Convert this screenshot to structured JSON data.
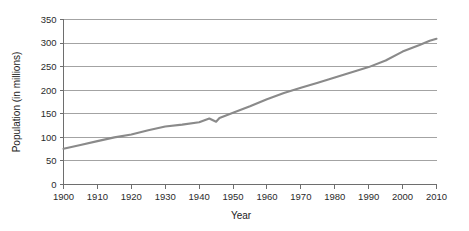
{
  "chart_data": {
    "type": "line",
    "title": "",
    "xlabel": "Year",
    "ylabel": "Population (in millions)",
    "xlim": [
      1900,
      2010
    ],
    "ylim": [
      0,
      350
    ],
    "grid": true,
    "legend": false,
    "line_color": "#8a8a8a",
    "x_ticks": [
      "1900",
      "1910",
      "1920",
      "1930",
      "1940",
      "1950",
      "1960",
      "1970",
      "1980",
      "1990",
      "2000",
      "2010"
    ],
    "y_ticks": [
      "0",
      "50",
      "100",
      "150",
      "200",
      "250",
      "300",
      "350"
    ],
    "series": [
      {
        "name": "Population",
        "x": [
          1900,
          1905,
          1910,
          1915,
          1920,
          1925,
          1930,
          1935,
          1940,
          1943,
          1945,
          1946,
          1950,
          1955,
          1960,
          1965,
          1970,
          1975,
          1980,
          1985,
          1990,
          1995,
          2000,
          2005,
          2008,
          2010
        ],
        "values": [
          76,
          84,
          92,
          100,
          106,
          115,
          123,
          127,
          132,
          140,
          133,
          141,
          152,
          166,
          181,
          194,
          205,
          216,
          227,
          238,
          249,
          263,
          282,
          296,
          305,
          309
        ]
      }
    ]
  },
  "axis_labels": {
    "x_title": "Year",
    "y_title": "Population (in millions)"
  }
}
